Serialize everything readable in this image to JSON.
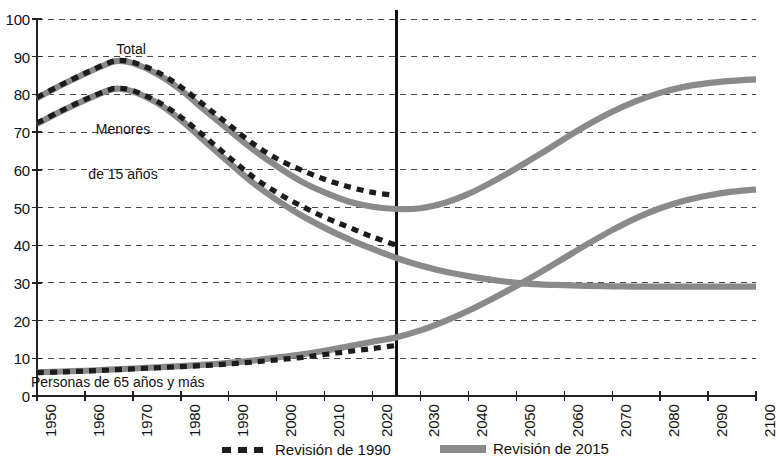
{
  "chart_data": {
    "type": "line",
    "title": "",
    "xlabel": "",
    "ylabel": "",
    "xlim": [
      1950,
      2100
    ],
    "ylim": [
      0,
      100
    ],
    "ytick_step": 10,
    "xtick_step": 10,
    "grid": "horizontal-dashed",
    "legend_position": "bottom",
    "xticks": [
      "1950",
      "1960",
      "1970",
      "1980",
      "1990",
      "2000",
      "2010",
      "2020",
      "2030",
      "2040",
      "2050",
      "2060",
      "2070",
      "2080",
      "2090",
      "2100"
    ],
    "yticks": [
      "0",
      "10",
      "20",
      "30",
      "40",
      "50",
      "60",
      "70",
      "80",
      "90",
      "100"
    ],
    "divider_year": 2025,
    "annotations": [
      {
        "text": "Total",
        "x": 1971,
        "y": 93
      },
      {
        "text": "Menores\nde 15 años",
        "x": 1975,
        "y": 78
      },
      {
        "text": "Personas de 65 años y más",
        "x": 1975,
        "y": 4
      }
    ],
    "series": [
      {
        "name": "Total — Revisión de 1990",
        "style": "dashed",
        "color": "#1c1c1c",
        "x": [
          1950,
          1955,
          1960,
          1965,
          1967,
          1970,
          1975,
          1980,
          1985,
          1990,
          1995,
          2000,
          2005,
          2010,
          2015,
          2020,
          2025
        ],
        "values": [
          79.2,
          82.5,
          85.6,
          88.4,
          89.0,
          88.5,
          86.0,
          82.0,
          77.0,
          72.0,
          67.0,
          63.0,
          60.0,
          57.5,
          55.5,
          54.0,
          53.2
        ]
      },
      {
        "name": "Total — Revisión de 2015",
        "style": "solid",
        "color": "#8a8a8a",
        "x": [
          1950,
          1955,
          1960,
          1965,
          1967,
          1970,
          1975,
          1980,
          1985,
          1990,
          1995,
          2000,
          2005,
          2010,
          2015,
          2020,
          2025,
          2030,
          2035,
          2040,
          2045,
          2050,
          2055,
          2060,
          2065,
          2070,
          2075,
          2080,
          2085,
          2090,
          2095,
          2100
        ],
        "values": [
          79.0,
          82.4,
          85.5,
          88.3,
          88.9,
          88.3,
          85.5,
          81.2,
          75.8,
          70.6,
          65.5,
          61.0,
          57.0,
          54.0,
          51.6,
          50.2,
          49.6,
          49.8,
          51.2,
          53.6,
          56.8,
          60.4,
          64.2,
          68.2,
          72.0,
          75.4,
          78.2,
          80.4,
          82.0,
          83.0,
          83.6,
          84.0
        ]
      },
      {
        "name": "Menores de 15 años — Revisión de 1990",
        "style": "dashed",
        "color": "#1c1c1c",
        "x": [
          1950,
          1955,
          1960,
          1965,
          1967,
          1970,
          1975,
          1980,
          1985,
          1990,
          1995,
          2000,
          2005,
          2010,
          2015,
          2020,
          2025
        ],
        "values": [
          72.4,
          75.6,
          78.6,
          81.2,
          81.6,
          81.0,
          78.2,
          74.0,
          68.8,
          63.4,
          58.2,
          54.0,
          50.5,
          47.4,
          44.8,
          42.2,
          40.0
        ]
      },
      {
        "name": "Menores de 15 años — Revisión de 2015",
        "style": "solid",
        "color": "#8a8a8a",
        "x": [
          1950,
          1955,
          1960,
          1965,
          1967,
          1970,
          1975,
          1980,
          1985,
          1990,
          1995,
          2000,
          2005,
          2010,
          2015,
          2020,
          2025,
          2030,
          2035,
          2040,
          2045,
          2050,
          2055,
          2060,
          2065,
          2070,
          2075,
          2080,
          2085,
          2090,
          2095,
          2100
        ],
        "values": [
          72.2,
          75.5,
          78.5,
          81.1,
          81.5,
          80.8,
          77.8,
          73.2,
          67.6,
          62.0,
          56.6,
          52.0,
          48.0,
          44.6,
          41.6,
          39.0,
          36.6,
          34.6,
          33.0,
          31.8,
          30.8,
          30.0,
          29.6,
          29.4,
          29.2,
          29.1,
          29.0,
          29.0,
          29.0,
          29.0,
          29.0,
          29.0
        ]
      },
      {
        "name": "Personas de 65 años y más — Revisión de 1990",
        "style": "dashed",
        "color": "#1c1c1c",
        "x": [
          1950,
          1955,
          1960,
          1965,
          1970,
          1975,
          1980,
          1985,
          1990,
          1995,
          2000,
          2005,
          2010,
          2015,
          2020,
          2025
        ],
        "values": [
          6.2,
          6.4,
          6.6,
          6.9,
          7.2,
          7.5,
          7.8,
          8.1,
          8.5,
          9.0,
          9.6,
          10.2,
          11.0,
          11.8,
          12.6,
          13.4
        ]
      },
      {
        "name": "Personas de 65 años y más — Revisión de 2015",
        "style": "solid",
        "color": "#8a8a8a",
        "x": [
          1950,
          1955,
          1960,
          1965,
          1970,
          1975,
          1980,
          1985,
          1990,
          1995,
          2000,
          2005,
          2010,
          2015,
          2020,
          2025,
          2030,
          2035,
          2040,
          2045,
          2050,
          2055,
          2060,
          2065,
          2070,
          2075,
          2080,
          2085,
          2090,
          2095,
          2100
        ],
        "values": [
          6.3,
          6.5,
          6.7,
          7.0,
          7.3,
          7.6,
          7.9,
          8.3,
          8.8,
          9.4,
          10.2,
          11.0,
          12.0,
          13.2,
          14.4,
          15.6,
          17.4,
          19.8,
          22.6,
          25.8,
          29.2,
          32.8,
          36.6,
          40.4,
          44.0,
          47.2,
          49.8,
          51.8,
          53.2,
          54.2,
          54.8
        ]
      }
    ]
  },
  "axes": {
    "y_labels": [
      "100",
      "90",
      "80",
      "70",
      "60",
      "50",
      "40",
      "30",
      "20",
      "10",
      "0"
    ],
    "x_labels": [
      "1950",
      "1960",
      "1970",
      "1980",
      "1990",
      "2000",
      "2010",
      "2020",
      "2030",
      "2040",
      "2050",
      "2060",
      "2070",
      "2080",
      "2090",
      "2100"
    ]
  },
  "annotations": {
    "total": "Total",
    "menores_line1": "Menores",
    "menores_line2": "de 15 años",
    "personas": "Personas de 65 años y más"
  },
  "legend": {
    "items": [
      {
        "label": "Revisión de 1990",
        "style": "dashed",
        "color": "#1c1c1c"
      },
      {
        "label": "Revisión de 2015",
        "style": "solid",
        "color": "#8a8a8a"
      }
    ]
  }
}
